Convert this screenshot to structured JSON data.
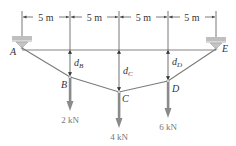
{
  "diagram": {
    "type": "cable-with-point-loads",
    "dimensions": [
      {
        "label": "5 m",
        "from": "A",
        "to": "B"
      },
      {
        "label": "5 m",
        "from": "B",
        "to": "C"
      },
      {
        "label": "5 m",
        "from": "C",
        "to": "D"
      },
      {
        "label": "5 m",
        "from": "D",
        "to": "E"
      }
    ],
    "supports": [
      {
        "label": "A"
      },
      {
        "label": "E"
      }
    ],
    "points": [
      {
        "label": "B"
      },
      {
        "label": "C"
      },
      {
        "label": "D"
      }
    ],
    "sags": [
      {
        "var": "d",
        "sub": "B"
      },
      {
        "var": "d",
        "sub": "C"
      },
      {
        "var": "d",
        "sub": "D"
      }
    ],
    "loads": [
      {
        "label": "2 kN",
        "at": "B"
      },
      {
        "label": "4 kN",
        "at": "C"
      },
      {
        "label": "6 kN",
        "at": "D"
      }
    ],
    "colors": {
      "line": "#555555",
      "cable": "#777777",
      "arrow": "#8a8a8a",
      "support": "#c8c8c8"
    }
  }
}
